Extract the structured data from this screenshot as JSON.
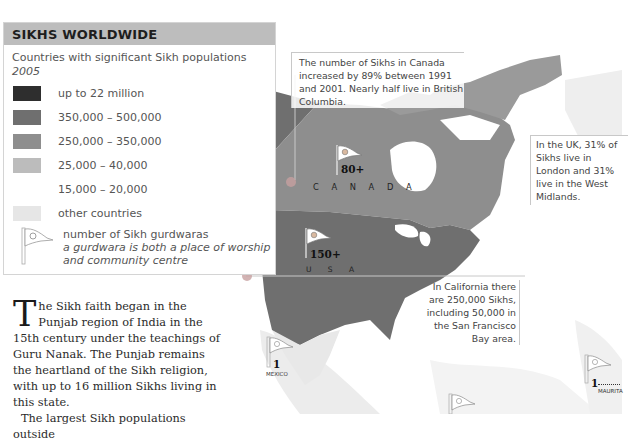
{
  "title": "SIKHS WORLDWIDE",
  "legend": {
    "subtitle": "Countries with significant Sikh populations",
    "year": "2005",
    "items": [
      {
        "label": "up to 22 million",
        "color": "#2e2e2e"
      },
      {
        "label": "350,000 – 500,000",
        "color": "#6f6f6f"
      },
      {
        "label": "250,000 – 350,000",
        "color": "#8e8e8e"
      },
      {
        "label": "25,000 – 40,000",
        "color": "#bcbcbc"
      },
      {
        "label": "15,000 – 20,000",
        "color": "#ffffff"
      },
      {
        "label": "other countries",
        "color": "#e6e6e6"
      }
    ],
    "flag_icon": "gurdwara-flag-icon",
    "flag_label": "number of Sikh gurdwaras",
    "flag_desc_1": "a gurdwara is both a place of worship",
    "flag_desc_2": "and community centre"
  },
  "body": {
    "dropcap": "T",
    "para1": "he Sikh faith began in the Punjab region of India in the 15th century under the teachings of Guru Nanak. The Punjab remains the heartland of the Sikh religion, with up to 16 million Sikhs living in this state.",
    "para2": "The largest Sikh populations outside"
  },
  "annotations": {
    "canada": "The number of Sikhs in Canada increased by 89% between 1991 and 2001. Nearly half live in British Columbia.",
    "uk": "In the UK, 31% of Sikhs live in London and 31% live in the West Midlands.",
    "california": "In California there are 250,000 Sikhs, including 50,000 in the San Francisco Bay area."
  },
  "map_labels": [
    {
      "country": "C A N A D A",
      "count": "80+"
    },
    {
      "country": "U S A",
      "count": "150+"
    },
    {
      "country": "MEXICO",
      "count": "1"
    },
    {
      "country": "MAURITA",
      "count": "1"
    }
  ],
  "colors": {
    "usa": "#6f6f6f",
    "canada": "#8e8e8e",
    "arctic": "#9a9a9a",
    "other": "#e6e6e6",
    "title_bar": "#bdbdbd"
  }
}
